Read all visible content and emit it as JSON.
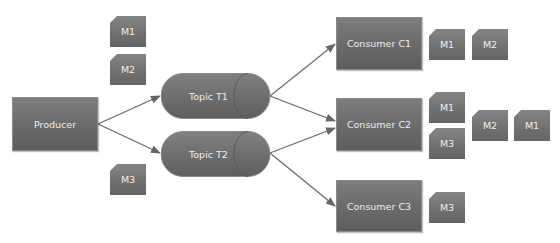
{
  "producer": {
    "label": "Producer"
  },
  "topics": [
    {
      "label": "Topic T1"
    },
    {
      "label": "Topic T2"
    }
  ],
  "consumers": [
    {
      "label": "Consumer C1"
    },
    {
      "label": "Consumer C2"
    },
    {
      "label": "Consumer C3"
    }
  ],
  "producer_messages": [
    "M1",
    "M2",
    "M3"
  ],
  "consumer_messages": {
    "c1": [
      "M1",
      "M2"
    ],
    "c2": [
      "M1",
      "M3",
      "M2",
      "M1"
    ],
    "c3": [
      "M3"
    ]
  },
  "colors": {
    "node_fill": "#6e6e6e",
    "arrow": "#666666",
    "text": "#eeeeee"
  }
}
